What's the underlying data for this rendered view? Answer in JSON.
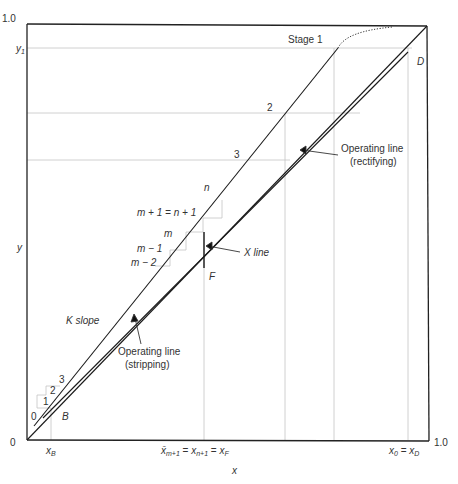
{
  "diagram": {
    "type": "McCabe-Thiele style multicomponent distillation diagram",
    "axes": {
      "x_label": "x",
      "y_label": "y",
      "origin_label": "0",
      "y_max_label": "1.0",
      "x_max_label": "1.0",
      "y1_label": "y",
      "y1_sub": "1"
    },
    "x_ticks": {
      "xB": {
        "main": "x",
        "sub": "B"
      },
      "xF": {
        "main1": "x̄",
        "sub1": "m+1",
        "eq1": " = ",
        "main2": "x",
        "sub2": "n+1",
        "eq2": " = ",
        "main3": "x",
        "sub3": "F"
      },
      "xD": {
        "main1": "x",
        "sub1": "0",
        "eq": " = ",
        "main2": "x",
        "sub2": "D"
      }
    },
    "labels": {
      "stage1": "Stage 1",
      "stage2": "2",
      "stage3": "3",
      "point_D": "D",
      "point_F": "F",
      "point_B": "B",
      "stage_n": "n",
      "stage_m1_n1": "m + 1 = n + 1",
      "stage_m": "m",
      "stage_m_minus_1": "m − 1",
      "stage_m_minus_2": "m − 2",
      "x_line": "X  line",
      "k_slope": "K  slope",
      "op_rect_1": "Operating line",
      "op_rect_2": "(rectifying)",
      "op_strip_1": "Operating line",
      "op_strip_2": "(stripping)",
      "bottom_stage_0": "0",
      "bottom_stage_1": "1",
      "bottom_stage_2": "2",
      "bottom_stage_3": "3"
    },
    "colors": {
      "axis": "#222222",
      "line": "#1a1a1a",
      "guide": "#bdbdbd",
      "text": "#333333"
    }
  }
}
